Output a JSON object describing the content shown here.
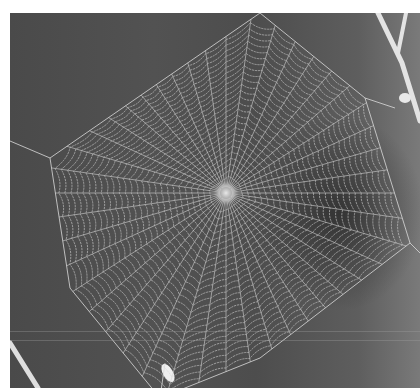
{
  "image": {
    "subject": "Orb spider web photographed against a dark gray background, with bare twigs at the edges",
    "palette": {
      "background": "#4e4e4e",
      "background_right": "#7a7a7a",
      "silk": "#d8d8d8",
      "twig": "#e6e6e6",
      "frame": "#ffffff"
    },
    "hub": {
      "x": 216,
      "y": 180
    },
    "web_outline": [
      [
        40,
        145
      ],
      [
        250,
        0
      ],
      [
        355,
        85
      ],
      [
        400,
        230
      ],
      [
        250,
        345
      ],
      [
        150,
        385
      ],
      [
        60,
        275
      ]
    ],
    "radial_count": 44,
    "spiral_count": 26
  }
}
